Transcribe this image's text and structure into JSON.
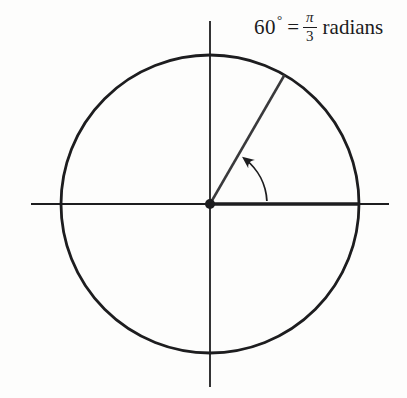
{
  "figure": {
    "angle_label": {
      "degrees": "60",
      "degree_symbol": "°",
      "equals": "=",
      "fraction_numerator": "π",
      "fraction_denominator": "3",
      "unit": "radians"
    },
    "colors": {
      "stroke": "#1d1d1f",
      "background": "#fdfdfc"
    },
    "geometry": {
      "center_x": 210,
      "center_y": 204,
      "circle_radius": 149,
      "dot_radius": 5,
      "axis_top_y": 21,
      "axis_bottom_y": 387,
      "axis_left_x": 31,
      "axis_right_x": 389,
      "angle_degrees": 60,
      "arc_radius": 57,
      "arc_start_deg": 3,
      "arc_end_deg": 52
    }
  }
}
